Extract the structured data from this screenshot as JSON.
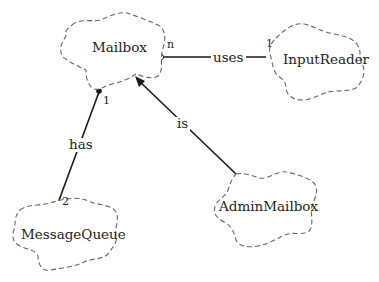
{
  "diagram": {
    "type": "class-diagram (Booch cloud notation)",
    "nodes": [
      {
        "id": "mailbox",
        "label": "Mailbox"
      },
      {
        "id": "inputreader",
        "label": "InputReader"
      },
      {
        "id": "messagequeue",
        "label": "MessageQueue"
      },
      {
        "id": "adminmailbox",
        "label": "AdminMailbox"
      }
    ],
    "edges": [
      {
        "id": "uses",
        "from": "mailbox",
        "to": "inputreader",
        "label": "uses",
        "from_mult": "n",
        "to_mult": "1",
        "from_end": "hollow-circle"
      },
      {
        "id": "has",
        "from": "messagequeue",
        "to": "mailbox",
        "label": "has",
        "from_mult": "2",
        "to_mult": "1",
        "to_end": "filled-circle"
      },
      {
        "id": "is",
        "from": "adminmailbox",
        "to": "mailbox",
        "label": "is",
        "to_end": "arrow"
      }
    ]
  }
}
